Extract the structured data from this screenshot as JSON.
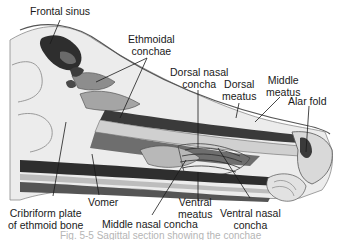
{
  "figure": {
    "caption": "Fig. 5-5 Sagittal section showing the conchae"
  },
  "labels": {
    "frontal_sinus": "Frontal sinus",
    "ethmoidal_conchae_1": "Ethmoidal",
    "ethmoidal_conchae_2": "conchae",
    "dorsal_nasal_concha_1": "Dorsal nasal",
    "dorsal_nasal_concha_2": "concha",
    "dorsal_meatus_1": "Dorsal",
    "dorsal_meatus_2": "meatus",
    "middle_meatus_1": "Middle",
    "middle_meatus_2": "meatus",
    "alar_fold": "Alar fold",
    "vomer": "Vomer",
    "cribriform_plate_1": "Cribriform plate",
    "cribriform_plate_2": "of ethmoid bone",
    "middle_nasal_concha": "Middle nasal concha",
    "ventral_meatus_1": "Ventral",
    "ventral_meatus_2": "meatus",
    "ventral_nasal_concha_1": "Ventral nasal",
    "ventral_nasal_concha_2": "concha"
  },
  "colors": {
    "ink": "#1a1a1a",
    "bone_light": "#e6e6e6",
    "shade_mid": "#9a9a9a",
    "shade_dark": "#3a3a3a",
    "caption": "#b5b5b5"
  }
}
